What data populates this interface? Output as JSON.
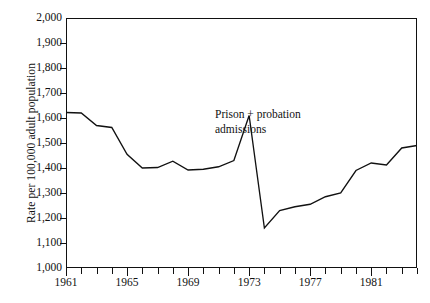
{
  "chart_data": {
    "type": "line",
    "title": "",
    "xlabel": "",
    "ylabel": "Rate per 100,000 adult population",
    "xlim": [
      1961,
      1984
    ],
    "ylim": [
      1000,
      2000
    ],
    "grid": false,
    "legend_position": "none",
    "y_ticks": [
      1000,
      1100,
      1200,
      1300,
      1400,
      1500,
      1600,
      1700,
      1800,
      1900,
      2000
    ],
    "y_tick_labels": [
      "1,000",
      "1,100",
      "1,200",
      "1,300",
      "1,400",
      "1,500",
      "1,600",
      "1,700",
      "1,800",
      "1,900",
      "2,000"
    ],
    "x_ticks": [
      1961,
      1962,
      1963,
      1964,
      1965,
      1966,
      1967,
      1968,
      1969,
      1970,
      1971,
      1972,
      1973,
      1974,
      1975,
      1976,
      1977,
      1978,
      1979,
      1980,
      1981,
      1982,
      1983,
      1984
    ],
    "x_tick_labels": [
      "1961",
      "",
      "",
      "",
      "1965",
      "",
      "",
      "",
      "1969",
      "",
      "",
      "",
      "1973",
      "",
      "",
      "",
      "1977",
      "",
      "",
      "",
      "1981",
      "",
      "",
      ""
    ],
    "x_major_ticks": [
      1961,
      1965,
      1969,
      1973,
      1977,
      1981
    ],
    "annotations": [
      {
        "text": "Prison + probation\nadmissions",
        "x": 1971,
        "y": 1610
      }
    ],
    "series": [
      {
        "name": "Prison + probation admissions",
        "color": "#111111",
        "x": [
          1961,
          1962,
          1963,
          1964,
          1965,
          1966,
          1967,
          1968,
          1969,
          1970,
          1971,
          1972,
          1973,
          1974,
          1975,
          1976,
          1977,
          1978,
          1979,
          1980,
          1981,
          1982,
          1983,
          1984
        ],
        "values": [
          1622,
          1620,
          1570,
          1562,
          1455,
          1400,
          1402,
          1427,
          1392,
          1395,
          1405,
          1430,
          1610,
          1160,
          1230,
          1245,
          1255,
          1285,
          1300,
          1390,
          1420,
          1412,
          1480,
          1490
        ]
      }
    ]
  },
  "axes": {
    "y_axis_title": "Rate per 100,000 adult population"
  }
}
